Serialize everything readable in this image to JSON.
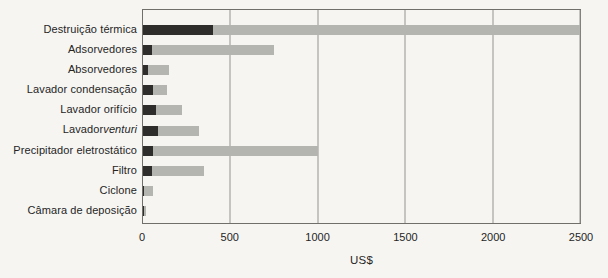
{
  "colors": {
    "background": "#f6f5f2",
    "bar_dark": "#2e2d2b",
    "bar_light": "#b4b4b1",
    "frame": "#716f6a",
    "gridline": "#96948f",
    "text": "#252525"
  },
  "chart_data": {
    "type": "bar",
    "orientation": "horizontal",
    "stacked": true,
    "title": "",
    "xlabel": "US$",
    "ylabel": "",
    "xlim": [
      0,
      2500
    ],
    "xticks": [
      "0",
      "500",
      "1000",
      "1500",
      "2000",
      "2500"
    ],
    "xtick_values": [
      0,
      500,
      1000,
      1500,
      2000,
      2500
    ],
    "grid": "vertical-only",
    "legend_position": "none",
    "categories": [
      "Destruição térmica",
      "Adsorvedores",
      "Absorvedores",
      "Lavador condensação",
      "Lavador orifício",
      "Lavador venturi",
      "Precipitador eletrostático",
      "Filtro",
      "Ciclone",
      "Câmara de deposição"
    ],
    "italic_parts": {
      "Lavador venturi": "venturi"
    },
    "series": [
      {
        "name": "dark",
        "color": "#2e2d2b",
        "values": [
          400,
          50,
          30,
          60,
          75,
          85,
          55,
          50,
          5,
          5
        ]
      },
      {
        "name": "light",
        "color": "#b4b4b1",
        "values": [
          2100,
          700,
          120,
          75,
          150,
          235,
          945,
          300,
          55,
          15
        ]
      }
    ],
    "totals": [
      2500,
      750,
      150,
      135,
      225,
      320,
      1000,
      350,
      60,
      20
    ]
  }
}
